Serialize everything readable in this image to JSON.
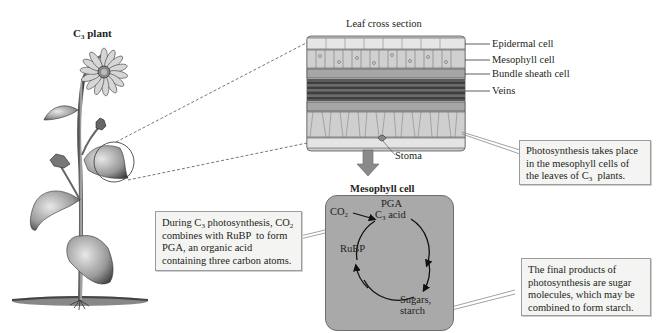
{
  "plant": {
    "title_prefix": "C",
    "title_sub": "3",
    "title_suffix": " plant"
  },
  "leaf_section": {
    "title": "Leaf cross section",
    "labels": [
      {
        "id": "epidermal",
        "text": "Epidermal cell"
      },
      {
        "id": "mesophyll",
        "text": "Mesophyll cell"
      },
      {
        "id": "bundle_sheath",
        "text": "Bundle sheath cell"
      },
      {
        "id": "veins",
        "text": "Veins"
      }
    ],
    "stoma_label": "Stoma"
  },
  "mesophyll_cell": {
    "title": "Mesophyll cell",
    "co2_prefix": "CO",
    "co2_sub": "2",
    "pga_label": "PGA",
    "c3_acid_prefix": "C",
    "c3_acid_sub": "3",
    "c3_acid_suffix": " acid",
    "rubp_label": "RuBP",
    "sugars_line1": "Sugars,",
    "sugars_line2": "starch"
  },
  "callouts": {
    "mesophyll_location": {
      "line1": "Photosynthesis takes place",
      "line2": "in the mesophyll cells of",
      "line3_prefix": "the leaves of C",
      "line3_sub": "3",
      "line3_suffix": "  plants."
    },
    "c3_process": {
      "line1_prefix": "During C",
      "line1_sub": "3",
      "line1_mid": " photosynthesis, CO",
      "line1_sub2": "2",
      "line2": "combines with RuBP  to form",
      "line3": "PGA, an organic acid",
      "line4": "containing three carbon atoms."
    },
    "final_products": {
      "line1": "The final products of",
      "line2": "photosynthesis are sugar",
      "line3": "molecules, which may be",
      "line4": "combined to form starch."
    }
  },
  "colors": {
    "cell_fill": "#a9a9a9",
    "callout_fill": "#f4f4f2",
    "arrow_fill": "#8a8a8a",
    "text": "#231f20"
  }
}
